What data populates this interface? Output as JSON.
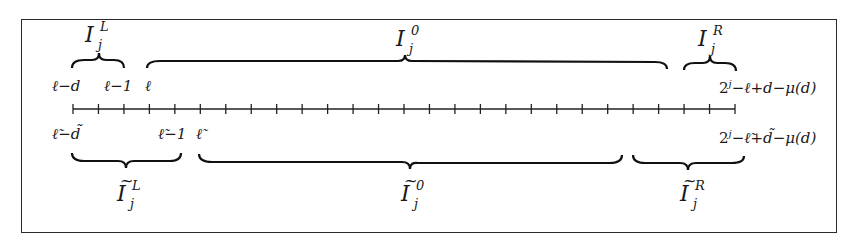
{
  "figure": {
    "type": "interval-partition-diagram",
    "axis": {
      "tick_count": 27,
      "first_tick_x": 73,
      "last_tick_x": 735,
      "y": 109
    },
    "top": {
      "labels": {
        "start": "ℓ−d",
        "left_end": "ℓ−1",
        "interior_start": "ℓ",
        "right_end_base": "2",
        "right_end_exp": "j",
        "right_end_rest": "−ℓ+d−μ(d)"
      },
      "braces": [
        {
          "name": "I_j^L",
          "symbol": "I",
          "sub": "j",
          "sup": "L",
          "tilde": false
        },
        {
          "name": "I_j^0",
          "symbol": "I",
          "sub": "j",
          "sup": "0",
          "tilde": false
        },
        {
          "name": "I_j^R",
          "symbol": "I",
          "sub": "j",
          "sup": "R",
          "tilde": false
        }
      ]
    },
    "bottom": {
      "labels": {
        "start": "ℓ̃−d̃",
        "left_end": "ℓ̃−1",
        "interior_start": "ℓ̃",
        "right_end_base": "2",
        "right_end_exp": "j",
        "right_end_rest": "−ℓ̃+d̃−μ(d)"
      },
      "braces": [
        {
          "name": "Ĩ_j^L",
          "symbol": "I",
          "sub": "j",
          "sup": "L",
          "tilde": true
        },
        {
          "name": "Ĩ_j^0",
          "symbol": "I",
          "sub": "j",
          "sup": "0",
          "tilde": true
        },
        {
          "name": "Ĩ_j^R",
          "symbol": "I",
          "sub": "j",
          "sup": "R",
          "tilde": true
        }
      ]
    },
    "tilde_char": "~"
  }
}
